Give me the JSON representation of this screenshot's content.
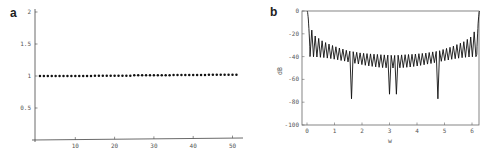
{
  "figure": {
    "panels": [
      {
        "label": "a"
      },
      {
        "label": "b"
      }
    ]
  },
  "chart_data": [
    {
      "panel": "a",
      "type": "scatter",
      "title": "",
      "xlabel": "",
      "ylabel": "",
      "xlim": [
        0,
        52
      ],
      "ylim": [
        0,
        2
      ],
      "xticks": [
        10,
        20,
        30,
        40,
        50
      ],
      "yticks": [
        0.5,
        1,
        1.5,
        2
      ],
      "ytick_labels": [
        "0.5",
        "1",
        "1.5",
        "2"
      ],
      "xtick_labels": [
        "10",
        "20",
        "30",
        "40",
        "50"
      ],
      "grid": false,
      "legend": null,
      "series": [
        {
          "name": "points",
          "x": [
            1,
            2,
            3,
            4,
            5,
            6,
            7,
            8,
            9,
            10,
            11,
            12,
            13,
            14,
            15,
            16,
            17,
            18,
            19,
            20,
            21,
            22,
            23,
            24,
            25,
            26,
            27,
            28,
            29,
            30,
            31,
            32,
            33,
            34,
            35,
            36,
            37,
            38,
            39,
            40,
            41,
            42,
            43,
            44,
            45,
            46,
            47,
            48,
            49,
            50,
            51
          ],
          "y": [
            1.0,
            1.0,
            1.0,
            1.0,
            1.0,
            1.0,
            1.0,
            1.0,
            1.0,
            1.0,
            1.0,
            1.0,
            1.0,
            1.0,
            1.005,
            1.005,
            1.005,
            1.005,
            1.005,
            1.005,
            1.005,
            1.005,
            1.005,
            1.005,
            1.01,
            1.01,
            1.01,
            1.01,
            1.01,
            1.01,
            1.01,
            1.01,
            1.01,
            1.01,
            1.015,
            1.015,
            1.015,
            1.015,
            1.015,
            1.015,
            1.015,
            1.015,
            1.015,
            1.02,
            1.02,
            1.02,
            1.02,
            1.02,
            1.02,
            1.02,
            1.02
          ]
        }
      ]
    },
    {
      "panel": "b",
      "type": "line",
      "title": "",
      "xlabel": "w",
      "ylabel": "dB",
      "xlim": [
        -0.15,
        6.45
      ],
      "ylim": [
        -100,
        0
      ],
      "xticks": [
        0,
        1,
        2,
        3,
        4,
        5,
        6
      ],
      "xtick_labels": [
        "0",
        "1",
        "2",
        "3",
        "4",
        "5",
        "6"
      ],
      "yticks": [
        0,
        -20,
        -40,
        -60,
        -80,
        -100
      ],
      "ytick_labels": [
        "0",
        "-20",
        "-40",
        "-60",
        "-80",
        "-100"
      ],
      "grid": false,
      "legend": null,
      "description": "Magnitude response in dB: 0 dB main lobe at w=0 and w=2π, ~50 sidelobes whose peaks form an upper envelope from about -15 dB near the edges to about -38 dB at center; nulls mostly near -40 to -55 dB with deep notches of about -77 dB near w≈1.6 and w≈4.7 and about -73 dB near w≈3.05 and w≈3.2",
      "series": [
        {
          "name": "upper envelope (sidelobe peaks)",
          "x": [
            0.0,
            0.13,
            0.3,
            0.6,
            1.0,
            1.5,
            2.0,
            2.5,
            3.14,
            3.8,
            4.3,
            4.8,
            5.3,
            5.7,
            6.0,
            6.15,
            6.28
          ],
          "y": [
            0,
            -15,
            -22,
            -27,
            -31,
            -35,
            -37,
            -38,
            -39,
            -38,
            -37,
            -35,
            -31,
            -27,
            -22,
            -15,
            0
          ]
        },
        {
          "name": "deep nulls",
          "x": [
            1.6,
            3.05,
            3.22,
            4.7
          ],
          "y": [
            -77,
            -73,
            -73,
            -77
          ]
        }
      ]
    }
  ]
}
